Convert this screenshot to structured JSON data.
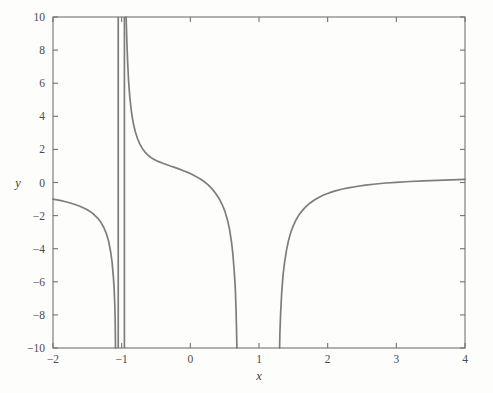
{
  "figure": {
    "background_color": "#fdfdfc",
    "frame_color": "#737373",
    "curve_color": "#7d7d7d"
  },
  "chart_data": {
    "type": "line",
    "title": "",
    "subtitle": "",
    "xlabel": "x",
    "ylabel": "y",
    "xlim": [
      -2,
      4
    ],
    "ylim": [
      -10,
      10
    ],
    "grid": false,
    "legend": null,
    "x_ticks": [
      -2,
      -1,
      0,
      1,
      2,
      3,
      4
    ],
    "x_tick_labels": [
      "−2",
      "−1",
      "0",
      "1",
      "2",
      "3",
      "4"
    ],
    "y_ticks": [
      -10,
      -8,
      -6,
      -4,
      -2,
      0,
      2,
      4,
      6,
      8,
      10
    ],
    "y_tick_labels": [
      "−10",
      "−8",
      "−6",
      "−4",
      "−2",
      "0",
      "2",
      "4",
      "6",
      "8",
      "10"
    ],
    "annotations": [],
    "vertical_asymptotes": [
      -1.05,
      -0.96
    ],
    "series": [
      {
        "name": "branch-left",
        "comment": "x from -2 up to the left asymptote; starts near y=-1 and plunges to -10",
        "x": [
          -2.0,
          -1.9,
          -1.8,
          -1.7,
          -1.6,
          -1.5,
          -1.45,
          -1.4,
          -1.35,
          -1.3,
          -1.26,
          -1.22,
          -1.19,
          -1.16,
          -1.14,
          -1.12,
          -1.11,
          -1.1,
          -1.095,
          -1.09
        ],
        "y": [
          -1.0,
          -1.08,
          -1.18,
          -1.3,
          -1.45,
          -1.65,
          -1.78,
          -1.95,
          -2.15,
          -2.42,
          -2.72,
          -3.12,
          -3.55,
          -4.2,
          -4.8,
          -5.75,
          -6.4,
          -7.4,
          -8.2,
          -10.0
        ]
      },
      {
        "name": "branch-middle",
        "comment": "from the right asymptote near x=-0.96 down through an S-bend to -10 near x=0.68",
        "x": [
          -0.935,
          -0.93,
          -0.925,
          -0.92,
          -0.91,
          -0.9,
          -0.89,
          -0.88,
          -0.86,
          -0.84,
          -0.82,
          -0.8,
          -0.77,
          -0.74,
          -0.7,
          -0.66,
          -0.62,
          -0.57,
          -0.52,
          -0.46,
          -0.4,
          -0.34,
          -0.28,
          -0.22,
          -0.16,
          -0.1,
          -0.04,
          0.02,
          0.08,
          0.14,
          0.2,
          0.26,
          0.32,
          0.37,
          0.42,
          0.46,
          0.5,
          0.54,
          0.57,
          0.6,
          0.62,
          0.64,
          0.655,
          0.665,
          0.672,
          0.678
        ],
        "y": [
          10.0,
          9.3,
          8.6,
          8.0,
          7.0,
          6.2,
          5.6,
          5.1,
          4.35,
          3.8,
          3.38,
          3.05,
          2.66,
          2.36,
          2.06,
          1.84,
          1.66,
          1.5,
          1.38,
          1.26,
          1.16,
          1.07,
          0.98,
          0.9,
          0.81,
          0.71,
          0.61,
          0.5,
          0.37,
          0.23,
          0.06,
          -0.14,
          -0.4,
          -0.66,
          -0.98,
          -1.3,
          -1.7,
          -2.25,
          -2.8,
          -3.6,
          -4.35,
          -5.4,
          -6.4,
          -7.6,
          -8.7,
          -10.0
        ]
      },
      {
        "name": "branch-right",
        "comment": "rises from -10 near x=1.30 and flattens toward y~0.2 at x=4",
        "x": [
          1.3,
          1.305,
          1.315,
          1.33,
          1.35,
          1.37,
          1.4,
          1.43,
          1.46,
          1.5,
          1.54,
          1.58,
          1.63,
          1.68,
          1.74,
          1.8,
          1.87,
          1.94,
          2.02,
          2.1,
          2.2,
          2.3,
          2.42,
          2.55,
          2.7,
          2.85,
          3.0,
          3.2,
          3.4,
          3.6,
          3.8,
          4.0
        ],
        "y": [
          -10.0,
          -9.0,
          -7.9,
          -6.7,
          -5.6,
          -4.9,
          -4.1,
          -3.5,
          -3.05,
          -2.6,
          -2.25,
          -1.97,
          -1.7,
          -1.47,
          -1.25,
          -1.07,
          -0.9,
          -0.76,
          -0.63,
          -0.52,
          -0.41,
          -0.32,
          -0.24,
          -0.16,
          -0.09,
          -0.03,
          0.01,
          0.06,
          0.1,
          0.13,
          0.16,
          0.19
        ]
      }
    ]
  }
}
